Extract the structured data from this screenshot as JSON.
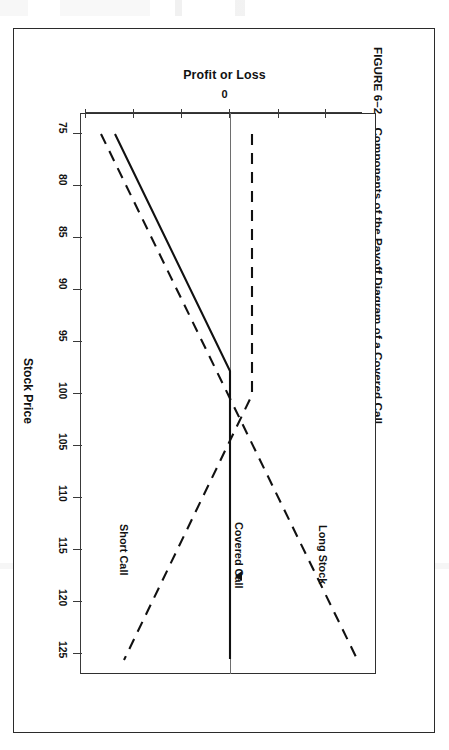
{
  "figure": {
    "number": "FIGURE 6–2",
    "caption": "Components of the Payoff Diagram of a Covered Call"
  },
  "chart_data": {
    "type": "line",
    "title": "Components of the Payoff Diagram of a Covered Call",
    "orientation": "rotated-90-clockwise",
    "xlabel": "Stock Price",
    "ylabel": "Profit or Loss",
    "x": [
      75,
      80,
      85,
      90,
      95,
      100,
      105,
      110,
      115,
      120,
      125
    ],
    "xticklabels": [
      "75",
      "80",
      "85",
      "90",
      "95",
      "100",
      "105",
      "110",
      "115",
      "120",
      "125"
    ],
    "xlim": [
      73,
      127
    ],
    "yticklabels": [
      "0"
    ],
    "ylim": [
      -27,
      27
    ],
    "grid": false,
    "legend": "inline-annotations",
    "strike": 100,
    "series": [
      {
        "name": "Long Stock",
        "style": "dashed",
        "values": [
          -25,
          -20,
          -15,
          -10,
          -5,
          0,
          5,
          10,
          15,
          20,
          25
        ]
      },
      {
        "name": "Short Call",
        "style": "dashed",
        "values": [
          5,
          5,
          5,
          5,
          5,
          5,
          0,
          -5,
          -10,
          -15,
          -20
        ]
      },
      {
        "name": "Covered Call",
        "style": "solid",
        "values": [
          -20,
          -15,
          -10,
          -5,
          0,
          5,
          5,
          5,
          5,
          5,
          5
        ]
      }
    ],
    "annotations": [
      {
        "label": "Short Call",
        "near_x": 118
      },
      {
        "label": "Covered Call",
        "near_x": 120
      },
      {
        "label": "Long Stock",
        "near_x": 118
      }
    ]
  },
  "axes": {
    "profit_loss": {
      "title": "Profit or Loss",
      "zero_label": "0",
      "tick_count": 6
    },
    "stock_price": {
      "title": "Stock Price",
      "ticks": [
        "75",
        "80",
        "85",
        "90",
        "95",
        "100",
        "105",
        "110",
        "115",
        "120",
        "125"
      ]
    }
  },
  "colors": {
    "ink": "#111111",
    "rule": "#2b2b2b",
    "axis": "#3a3a3a",
    "zero_line": "#6e6e6e",
    "paper": "#ffffff"
  }
}
